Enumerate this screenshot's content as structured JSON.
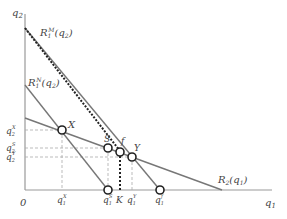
{
  "axes": {
    "y_label": "q2",
    "x_label": "q1",
    "origin_label": "0"
  },
  "curves": {
    "monopoly_reaction": {
      "base": "R",
      "sub": "1",
      "sup": "M",
      "arg": "(q",
      "arg_sub": "2",
      "arg_close": ")"
    },
    "nash_reaction": {
      "base": "R",
      "sub": "1",
      "sup": "N",
      "arg": "(q",
      "arg_sub": "2",
      "arg_close": ")"
    },
    "firm2_reaction": {
      "base": "R",
      "sub": "2",
      "arg": "(q",
      "arg_sub": "1",
      "arg_close": ")"
    }
  },
  "points": {
    "X": "X",
    "S": "S",
    "f": "f",
    "Y": "Y"
  },
  "y_ticks": [
    {
      "base": "q",
      "sub": "2",
      "sup": "X"
    },
    {
      "base": "q",
      "sub": "2",
      "sup": "S"
    },
    {
      "base": "q",
      "sub": "2",
      "sup": "Y"
    }
  ],
  "x_ticks": [
    {
      "base": "q",
      "sub": "1",
      "sup": "X"
    },
    {
      "base": "q",
      "sub": "1",
      "sup": "S"
    },
    {
      "base": "K"
    },
    {
      "base": "q",
      "sub": "1",
      "sup": "Y"
    },
    {
      "base": "q",
      "sub": "1",
      "sup": "f"
    }
  ],
  "colors": {
    "axis": "#999999",
    "line": "#777777",
    "dashed_heavy": "#222222",
    "guide": "#aaaaaa"
  }
}
